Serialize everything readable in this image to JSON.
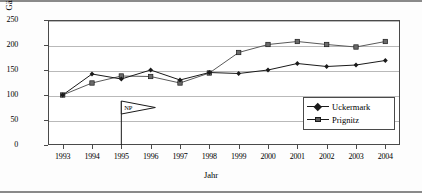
{
  "chart_data": {
    "type": "line",
    "title": "",
    "xlabel": "Jahr",
    "ylabel": "Gästeübernachtungen (Index)",
    "categories": [
      "1993",
      "1994",
      "1995",
      "1996",
      "1997",
      "1998",
      "1999",
      "2000",
      "2001",
      "2002",
      "2003",
      "2004"
    ],
    "ylim": [
      0,
      250
    ],
    "yticks": [
      0,
      50,
      100,
      150,
      200,
      250
    ],
    "grid": true,
    "legend_position": "right-bottom-inside",
    "series": [
      {
        "name": "Uckermark",
        "marker": "diamond",
        "color": "#1a1a1a",
        "values": [
          100,
          142,
          132,
          150,
          130,
          145,
          143,
          150,
          163,
          157,
          160,
          169
        ]
      },
      {
        "name": "Prignitz",
        "marker": "square",
        "color": "#5a5a5a",
        "values": [
          100,
          124,
          138,
          137,
          124,
          144,
          185,
          201,
          207,
          201,
          196,
          207
        ]
      }
    ],
    "annotations": [
      {
        "label": "NP",
        "x_category": "1995",
        "type": "pennant-flag"
      }
    ]
  },
  "axis": {
    "y_tick_labels": [
      "250",
      "200",
      "150",
      "100",
      "50",
      "0"
    ],
    "x_tick_labels": [
      "1993",
      "1994",
      "1995",
      "1996",
      "1997",
      "1998",
      "1999",
      "2000",
      "2001",
      "2002",
      "2003",
      "2004"
    ]
  },
  "legend": {
    "items": [
      {
        "label": "Uckermark"
      },
      {
        "label": "Prignitz"
      }
    ]
  }
}
